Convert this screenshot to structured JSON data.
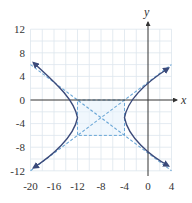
{
  "figure": {
    "axis_labels": {
      "x": "x",
      "y": "y"
    },
    "x_ticks": [
      "-20",
      "-16",
      "-12",
      "-8",
      "-4",
      "0",
      "4"
    ],
    "y_ticks": [
      "12",
      "8",
      "4",
      "0",
      "-4",
      "-8",
      "-12"
    ],
    "x_range": [
      -20,
      4
    ],
    "y_range": [
      -12,
      12
    ],
    "grid_step": 2,
    "colors": {
      "grid": "#dde6ee",
      "axis": "#333333",
      "curve": "#3b4a7a",
      "asymptote": "#6aa6d6",
      "box_fill": "#e6f2fb"
    },
    "hyperbola": {
      "center": [
        -8,
        -3
      ],
      "a": 4,
      "b": 3,
      "vertices": [
        [
          -12,
          -3
        ],
        [
          -4,
          -3
        ]
      ],
      "asymptotes": [
        "y + 3 = 3/4 (x + 8)",
        "y + 3 = -3/4 (x + 8)"
      ]
    }
  }
}
